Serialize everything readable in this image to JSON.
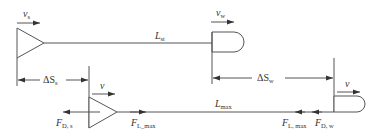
{
  "diagram": {
    "type": "vehicle-following-distance schematic",
    "top_row": {
      "rear_vehicle": {
        "shape": "triangle",
        "velocity_label": "v",
        "velocity_sub": "s"
      },
      "front_vehicle": {
        "shape": "d-shape",
        "velocity_label": "v",
        "velocity_sub": "w"
      },
      "gap_label": "L",
      "gap_sub": "st"
    },
    "displacements": {
      "rear": {
        "label": "ΔS",
        "sub": "s"
      },
      "front": {
        "label": "ΔS",
        "sub": "w"
      }
    },
    "bottom_row": {
      "rear_vehicle": {
        "shape": "triangle",
        "velocity_label": "v"
      },
      "front_vehicle": {
        "shape": "d-shape",
        "velocity_label": "v"
      },
      "gap_label": "L",
      "gap_sub": "max",
      "forces": [
        {
          "label": "F",
          "sub": "D, s",
          "position": "rear-vehicle",
          "direction": "left"
        },
        {
          "label": "F",
          "sub": "L_max",
          "position": "rear-gap",
          "direction": "right"
        },
        {
          "label": "F",
          "sub": "L, max",
          "position": "front-gap",
          "direction": "left"
        },
        {
          "label": "F",
          "sub": "D, w",
          "position": "front-vehicle",
          "direction": "left"
        }
      ]
    }
  }
}
